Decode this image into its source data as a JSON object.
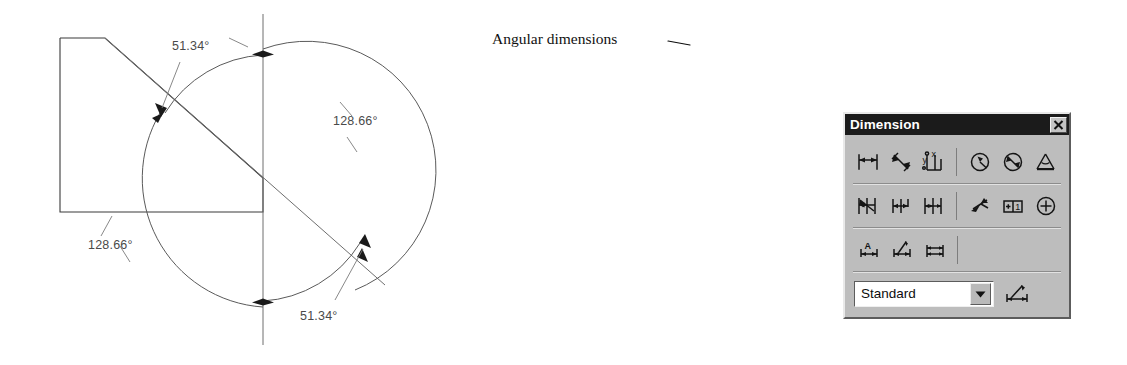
{
  "figure": {
    "annotation_label": "Angular dimensions",
    "dimensions": [
      {
        "id": "upper-left",
        "value": "51.34°",
        "x": 172,
        "y": 50
      },
      {
        "id": "right",
        "value": "128.66°",
        "x": 333,
        "y": 125
      },
      {
        "id": "lower-left",
        "value": "128.66°",
        "x": 88,
        "y": 249
      },
      {
        "id": "lower-right",
        "value": "51.34°",
        "x": 300,
        "y": 320
      }
    ],
    "geometry": {
      "circle_center_x": 263,
      "circle_center_y": 178,
      "circle_radius": 105,
      "vertical_line_top_y": 14,
      "vertical_line_bottom_y": 345,
      "polygon_points": "60,38 105,38 263,178 263,212 60,212"
    }
  },
  "toolbar": {
    "title": "Dimension",
    "close_label": "×",
    "rows": [
      {
        "id": "row-1",
        "buttons": [
          {
            "id": "linear-dimension",
            "name": "linear-dimension-icon"
          },
          {
            "id": "aligned-dimension",
            "name": "aligned-dimension-icon"
          },
          {
            "id": "ordinate-dimension",
            "name": "ordinate-dimension-icon"
          },
          {
            "id": "radius-dimension",
            "name": "radius-dimension-icon"
          },
          {
            "id": "diameter-dimension",
            "name": "diameter-dimension-icon"
          },
          {
            "id": "angular-dimension",
            "name": "angular-dimension-icon"
          }
        ]
      },
      {
        "id": "row-2",
        "buttons": [
          {
            "id": "quick-dimension",
            "name": "quick-dimension-icon"
          },
          {
            "id": "baseline-dimension",
            "name": "baseline-dimension-icon"
          },
          {
            "id": "continue-dimension",
            "name": "continue-dimension-icon"
          },
          {
            "id": "quick-leader",
            "name": "quick-leader-icon"
          },
          {
            "id": "tolerance",
            "name": "tolerance-icon"
          },
          {
            "id": "center-mark",
            "name": "center-mark-icon"
          }
        ]
      },
      {
        "id": "row-3",
        "buttons": [
          {
            "id": "dimension-edit",
            "name": "dimension-edit-icon"
          },
          {
            "id": "dimension-text-edit",
            "name": "dimension-text-edit-icon"
          },
          {
            "id": "dimension-update",
            "name": "dimension-update-icon"
          }
        ]
      }
    ],
    "style_combo": {
      "value": "Standard",
      "arrow_glyph": "▼"
    },
    "style_button_label": "dimension-style-button"
  },
  "colors": {
    "titlebar_bg": "#1b1b1b",
    "toolbar_face": "#bdbdbd",
    "drawing_line": "#3a3a3a",
    "callout_line": "#0d0d0d",
    "page_bg": "#ffffff"
  }
}
